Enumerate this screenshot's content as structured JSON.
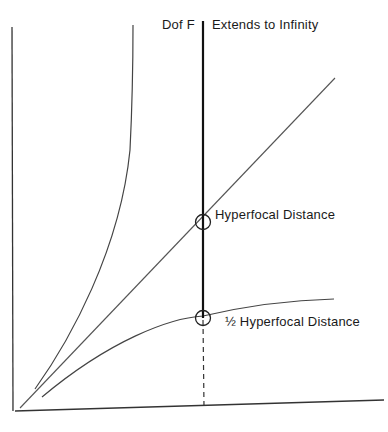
{
  "diagram": {
    "title_left": "Dof F",
    "title_right": "Extends to Infinity",
    "labels": {
      "hyperfocal": "Hyperfocal Distance",
      "half_hyperfocal": "½ Hyperfocal Distance"
    },
    "colors": {
      "line": "#1a1a1a",
      "thin_line": "#444444",
      "background": "#ffffff"
    },
    "elements": [
      {
        "id": "y-axis",
        "type": "axis"
      },
      {
        "id": "x-axis",
        "type": "axis"
      },
      {
        "id": "far-limit-curve",
        "type": "curve",
        "description": "steep curve rising to infinity"
      },
      {
        "id": "focus-distance-line",
        "type": "line",
        "description": "diagonal straight line"
      },
      {
        "id": "near-limit-curve",
        "type": "curve",
        "description": "curve flattening toward half hyperfocal"
      },
      {
        "id": "hyperfocal-line",
        "type": "line",
        "description": "thick vertical line at hyperfocal setting"
      },
      {
        "id": "hyperfocal-marker",
        "type": "circle"
      },
      {
        "id": "half-hyperfocal-marker",
        "type": "circle"
      }
    ]
  }
}
